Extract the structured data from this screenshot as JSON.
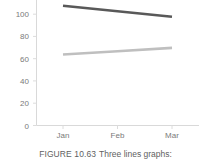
{
  "figure": {
    "caption_label": "FIGURE 10.63",
    "caption_text": "Three lines graphs:"
  },
  "chart_data": {
    "type": "line",
    "title": "",
    "xlabel": "",
    "ylabel": "",
    "categories": [
      "Jan",
      "Feb",
      "Mar"
    ],
    "ylim": [
      0,
      110
    ],
    "yticks": [
      0,
      20,
      40,
      60,
      80,
      100
    ],
    "ytick_labels": [
      "0",
      "20",
      "40",
      "60",
      "80",
      "100"
    ],
    "grid": false,
    "legend": "none",
    "series": [
      {
        "name": "dark-line",
        "color": "#595959",
        "values": [
          108,
          103,
          98
        ]
      },
      {
        "name": "light-line",
        "color": "#bfbfbf",
        "values": [
          64,
          67,
          70
        ]
      }
    ]
  },
  "axis": {
    "axis_color": "#d4d4d4"
  }
}
